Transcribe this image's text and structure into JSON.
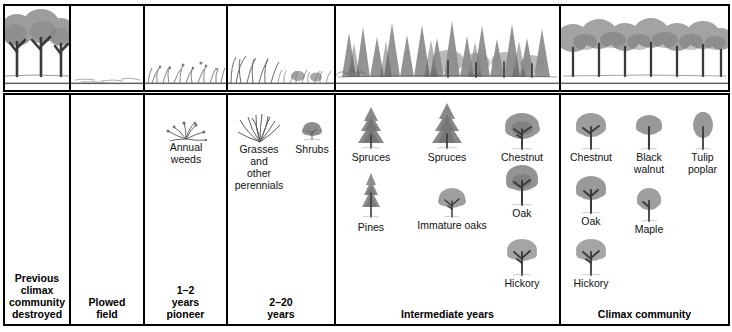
{
  "figure": {
    "colors": {
      "border": "#000000",
      "background": "#ffffff",
      "ink": "#6f6f6f",
      "text": "#111111"
    },
    "stages": [
      {
        "id": "previous-climax",
        "caption": "Previous\nclimax\ncommunity\ndestroyed",
        "scene": "mature-deciduous-forest",
        "specimens": []
      },
      {
        "id": "plowed-field",
        "caption": "Plowed\nfield",
        "scene": "bare-plowed-ground",
        "specimens": []
      },
      {
        "id": "pioneer",
        "caption": "1–2\nyears\npioneer",
        "scene": "annual-weeds-field",
        "specimens": [
          {
            "label": "Annual\nweeds",
            "icon": "weed-clump-icon"
          }
        ]
      },
      {
        "id": "grasses-shrubs",
        "caption": "2–20\nyears",
        "scene": "grassland-with-shrubs",
        "specimens": [
          {
            "label": "Grasses\nand\nother\nperennials",
            "icon": "grass-tuft-icon"
          },
          {
            "label": "Shrubs",
            "icon": "shrub-icon"
          }
        ]
      },
      {
        "id": "intermediate",
        "caption": "Intermediate years",
        "scene": "conifer-forest-with-young-hardwoods",
        "specimens": [
          {
            "label": "Spruces",
            "icon": "spruce-tree-icon"
          },
          {
            "label": "Spruces",
            "icon": "spruce-tree-icon"
          },
          {
            "label": "Chestnut",
            "icon": "chestnut-tree-icon"
          },
          {
            "label": "Pines",
            "icon": "pine-tree-icon"
          },
          {
            "label": "Immature oaks",
            "icon": "immature-oak-icon"
          },
          {
            "label": "Oak",
            "icon": "oak-tree-icon"
          },
          {
            "label": "Hickory",
            "icon": "hickory-tree-icon"
          }
        ]
      },
      {
        "id": "climax",
        "caption": "Climax community",
        "scene": "mature-hardwood-forest",
        "specimens": [
          {
            "label": "Chestnut",
            "icon": "chestnut-tree-icon"
          },
          {
            "label": "Black\nwalnut",
            "icon": "black-walnut-tree-icon"
          },
          {
            "label": "Tulip\npoplar",
            "icon": "tulip-poplar-tree-icon"
          },
          {
            "label": "Oak",
            "icon": "oak-tree-icon"
          },
          {
            "label": "Maple",
            "icon": "maple-tree-icon"
          },
          {
            "label": "Hickory",
            "icon": "hickory-tree-icon"
          }
        ]
      }
    ]
  }
}
